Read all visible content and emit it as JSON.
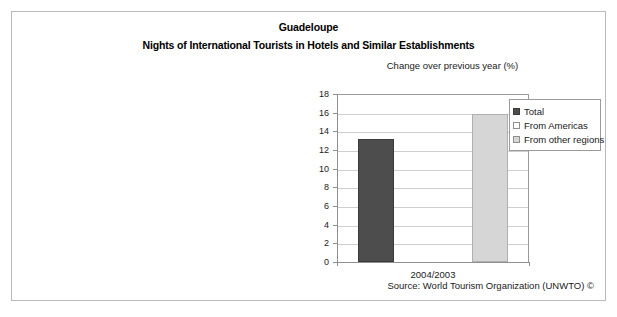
{
  "figure": {
    "title": "Guadeloupe",
    "subtitle": "Nights of International Tourists in Hotels and Similar Establishments",
    "source": "Source: World Tourism Organization (UNWTO) ©"
  },
  "chart_data": {
    "type": "bar",
    "title": "Change over previous year (%)",
    "xlabel": "",
    "ylabel": "",
    "categories": [
      "2004/2003"
    ],
    "series": [
      {
        "name": "Total",
        "values": [
          13.2
        ],
        "color": "#4d4d4d"
      },
      {
        "name": "From Americas",
        "values": [
          0
        ],
        "color": "#ffffff"
      },
      {
        "name": "From other regions",
        "values": [
          15.9
        ],
        "color": "#d6d6d6"
      }
    ],
    "ylim": [
      0,
      18
    ],
    "ytick_step": 2,
    "yticks": [
      18,
      16,
      14,
      12,
      10,
      8,
      6,
      4,
      2,
      0
    ],
    "grid": true,
    "legend_position": "top-right"
  },
  "legend": {
    "items": [
      {
        "label": "Total"
      },
      {
        "label": "From Americas"
      },
      {
        "label": "From other regions"
      }
    ]
  }
}
